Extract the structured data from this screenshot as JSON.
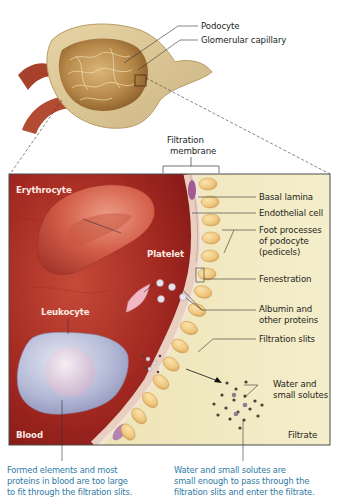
{
  "figure": {
    "overview_labels": {
      "podocyte": "Podocyte",
      "glomerular_capillary": "Glomerular capillary"
    },
    "filtration_membrane_label": [
      "Filtration",
      "membrane"
    ],
    "blood_side_labels": {
      "erythrocyte": "Erythrocyte",
      "platelet": "Platelet",
      "leukocyte": "Leukocyte",
      "blood": "Blood"
    },
    "right_labels": {
      "basal_lamina": "Basal lamina",
      "endothelial_cell": "Endothelial cell",
      "foot_processes": [
        "Foot processes",
        "of podocyte",
        "(pedicels)"
      ],
      "fenestration": "Fenestration",
      "albumin": [
        "Albumin and",
        "other proteins"
      ],
      "filtration_slits": "Filtration slits",
      "water": [
        "Water and",
        "small solutes"
      ],
      "filtrate": "Filtrate"
    },
    "captions": {
      "left": [
        "Formed elements and most",
        "proteins in blood are too large",
        "to fit through the filtration slits."
      ],
      "right": [
        "Water and small solutes are",
        "small enough to pass through the",
        "filtration slits and enter the filtrate."
      ]
    },
    "colors": {
      "caption_blue": "#2e7aa6",
      "blood_red": "#9b1f1c",
      "filtrate_cream": "#f3ebc4",
      "podocyte_yellow": "#efc77e",
      "label_white": "#fbe9e2"
    }
  }
}
